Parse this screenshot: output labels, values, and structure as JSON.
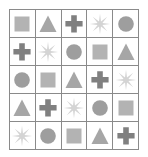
{
  "puzzle": {
    "type": "shape-grid",
    "rows": 5,
    "columns": 5,
    "description": "5 by 5 grid of gray geometric shapes arranged in a cyclic Latin square",
    "border_color": "#8a8a8a",
    "cell_background": "#ffffff",
    "shape_palette": {
      "square": "#b3b3b3",
      "triangle": "#a6a6a6",
      "cross": "#808080",
      "starburst": "#d4d4d4",
      "circle": "#9e9e9e"
    },
    "grid": [
      [
        "square",
        "triangle",
        "cross",
        "starburst",
        "circle"
      ],
      [
        "cross",
        "starburst",
        "circle",
        "square",
        "triangle"
      ],
      [
        "circle",
        "square",
        "triangle",
        "cross",
        "starburst"
      ],
      [
        "triangle",
        "cross",
        "starburst",
        "circle",
        "square"
      ],
      [
        "starburst",
        "circle",
        "square",
        "triangle",
        "cross"
      ]
    ]
  }
}
